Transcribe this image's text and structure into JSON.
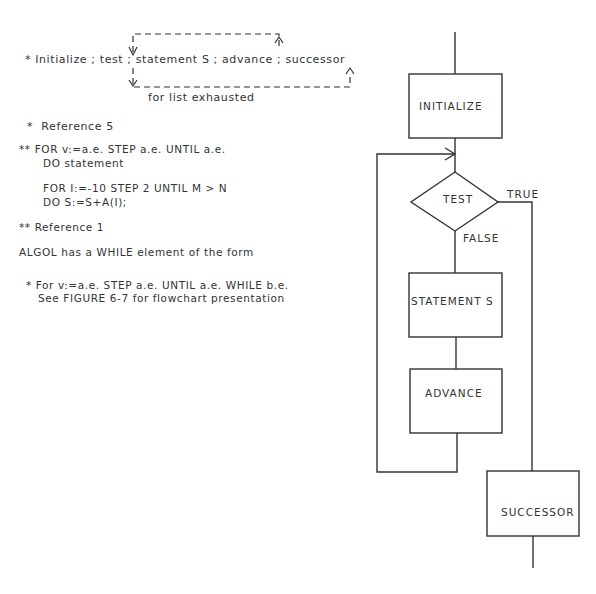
{
  "notes": {
    "loop_line": "* Initialize ; test ; statement S ; advance ; successor",
    "exhausted_label": "for list exhausted",
    "ref5": "*  Reference 5",
    "for_syntax_1": "** FOR v:=a.e. STEP a.e. UNTIL a.e.",
    "for_syntax_2": "DO statement",
    "example_1": "FOR I:=-10 STEP 2 UNTIL M > N",
    "example_2": "DO S:=S+A(I);",
    "ref1": "** Reference 1",
    "algol_line": "ALGOL has a WHILE element of the form",
    "while_syntax": "* For v:=a.e. STEP a.e. UNTIL a.e. WHILE b.e.",
    "see_figure": "See FIGURE 6-7 for flowchart presentation"
  },
  "flowchart": {
    "initialize": "INITIALIZE",
    "test": "TEST",
    "true_label": "TRUE",
    "false_label": "FALSE",
    "statement": "STATEMENT S",
    "advance": "ADVANCE",
    "successor": "SUCCESSOR"
  },
  "colors": {
    "ink": "#333333",
    "background": "#ffffff"
  }
}
